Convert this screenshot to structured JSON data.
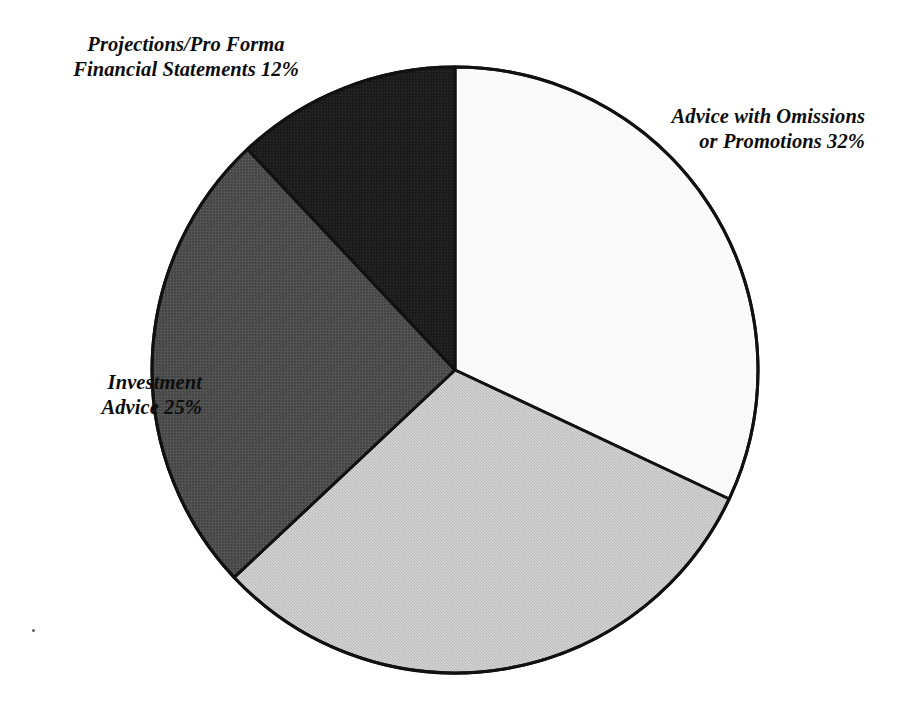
{
  "chart_data": {
    "type": "pie",
    "title": "",
    "subtitle": "",
    "xlabel": "",
    "ylabel": "",
    "legend_position": "none",
    "grid": false,
    "start_angle_deg": 0,
    "direction": "clockwise",
    "center": {
      "x": 455,
      "y": 370
    },
    "radius": 303,
    "categories": [
      "Advice with Omissions or Promotions",
      "",
      "Investment Advice",
      "Projections/Pro Forma Financial Statements"
    ],
    "values": [
      32,
      31,
      25,
      12
    ],
    "value_unit": "%",
    "slices": [
      {
        "name": "Advice with Omissions or Promotions",
        "value": 32,
        "value_text": "32%",
        "color": "#fafafa",
        "start_angle_deg": 0,
        "end_angle_deg": 115.2,
        "labeled": true
      },
      {
        "name": "",
        "value": 31,
        "value_text": "",
        "color": "#c9c9c9",
        "start_angle_deg": 115.2,
        "end_angle_deg": 226.8,
        "labeled": false
      },
      {
        "name": "Investment Advice",
        "value": 25,
        "value_text": "25%",
        "color": "#4a4a4a",
        "start_angle_deg": 226.8,
        "end_angle_deg": 316.8,
        "labeled": true
      },
      {
        "name": "Projections/Pro Forma Financial Statements",
        "value": 12,
        "value_text": "12%",
        "color": "#1e1e1e",
        "start_angle_deg": 316.8,
        "end_angle_deg": 360,
        "labeled": true
      }
    ],
    "annotations": [
      {
        "id": "projections",
        "text": "Projections/Pro Forma\nFinancial Statements 12%",
        "position": "top-left"
      },
      {
        "id": "advice_omissions",
        "text": "Advice with Omissions\nor Promotions 32%",
        "position": "right"
      },
      {
        "id": "investment",
        "text": "Investment\nAdvice 25%",
        "position": "left"
      }
    ]
  },
  "labels": {
    "projections": "Projections/Pro Forma\nFinancial Statements 12%",
    "advice_omissions": "Advice with Omissions\nor Promotions 32%",
    "investment": "Investment\nAdvice 25%"
  },
  "colors": {
    "slice_advice_omissions": "#fafafa",
    "slice_unlabeled": "#c9c9c9",
    "slice_investment_advice": "#4a4a4a",
    "slice_projections": "#1e1e1e",
    "outline": "#111111",
    "background": "#ffffff",
    "text": "#0d0d0d"
  }
}
